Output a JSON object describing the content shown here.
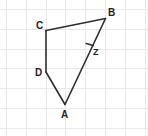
{
  "figure": {
    "background_color": "#ffffff",
    "stroke_color": "#2e2e33",
    "grid_color": "#e9e9ec",
    "width": 148,
    "height": 136,
    "grid": {
      "visible": true,
      "spacing": 19.8,
      "x_offset": 6.5,
      "y_offset": 9.5
    },
    "labels": {
      "a": "A",
      "b": "B",
      "c": "C",
      "d": "D",
      "z": "Z"
    },
    "points": [
      {
        "name": "A",
        "x": 65,
        "y": 104.5
      },
      {
        "name": "B",
        "x": 105.5,
        "y": 18.5
      },
      {
        "name": "C",
        "x": 46,
        "y": 30.5
      },
      {
        "name": "D",
        "x": 46,
        "y": 72
      },
      {
        "name": "Z",
        "x": 90,
        "y": 44.5
      }
    ],
    "segments": [
      {
        "name": "segment-CB",
        "from": "C",
        "to": "B"
      },
      {
        "name": "segment-CD",
        "from": "C",
        "to": "D"
      },
      {
        "name": "segment-DA",
        "from": "D",
        "to": "A"
      },
      {
        "name": "segment-AB",
        "from": "A",
        "to": "B"
      }
    ],
    "marks": [
      {
        "name": "tick-on-AB-at-Z",
        "x": 90,
        "y": 44.5,
        "type": "single-tick"
      }
    ]
  }
}
